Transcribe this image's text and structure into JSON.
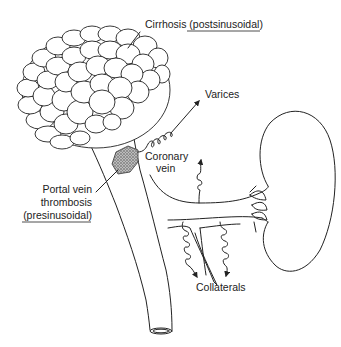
{
  "figure": {
    "labels": {
      "cirrhosis": {
        "prefix": "Cirrhosis ",
        "qualifier": "(postsinusoidal)"
      },
      "varices": "Varices",
      "coronary_vein_line1": "Coronary",
      "coronary_vein_line2": "vein",
      "portal_thrombosis_line1": "Portal vein",
      "portal_thrombosis_line2": "thrombosis",
      "portal_thrombosis_line3": "(presinusoidal)",
      "collaterals": "Collaterals"
    },
    "structures": [
      "liver (cirrhotic, nodular)",
      "portal vein",
      "thrombus",
      "coronary vein",
      "splenic vein",
      "spleen",
      "mesenteric veins",
      "collateral vessels"
    ],
    "colors": {
      "line": "#222222",
      "background": "#ffffff",
      "thrombus": "#888888"
    }
  }
}
